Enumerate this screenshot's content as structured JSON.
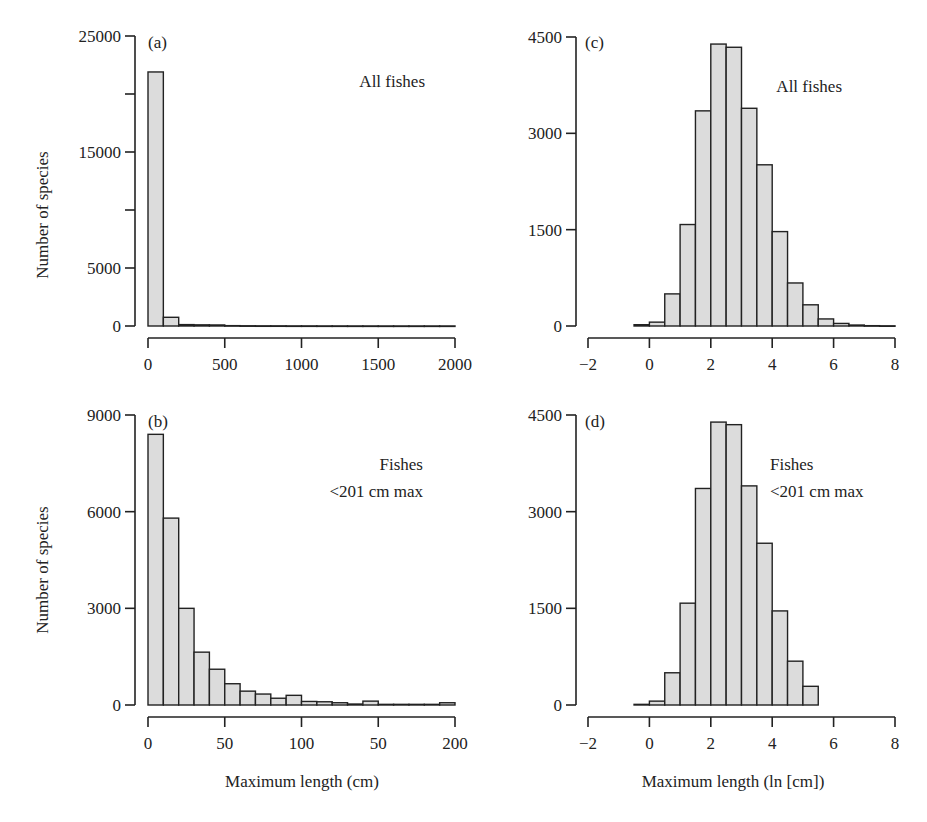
{
  "figure": {
    "y_axis_title": "Number of species",
    "x_axis_title_left": "Maximum length (cm)",
    "x_axis_title_right": "Maximum length (ln [cm])"
  },
  "colors": {
    "bar_fill": "#dcdcdc",
    "stroke": "#222222",
    "background": "#ffffff"
  },
  "chart_data": [
    {
      "id": "a",
      "type": "bar",
      "panel_label": "(a)",
      "annotation": [
        "All fishes"
      ],
      "title": "",
      "xlabel": "",
      "ylabel": "Number of species",
      "xlim": [
        0,
        2000
      ],
      "ylim": [
        0,
        25000
      ],
      "x_ticks": [
        0,
        500,
        1000,
        1500,
        2000
      ],
      "x_tick_labels": [
        "0",
        "500",
        "1000",
        "1500",
        "2000"
      ],
      "y_ticks": [
        0,
        5000,
        10000,
        15000,
        20000,
        25000
      ],
      "y_tick_labels": [
        "0",
        "5000",
        "",
        "15000",
        "",
        "25000"
      ],
      "bin_start": 0,
      "bin_width": 100,
      "values": [
        21900,
        750,
        120,
        100,
        90,
        30,
        20,
        15,
        15,
        10,
        10,
        8,
        8,
        6,
        6,
        5,
        5,
        5,
        5,
        5
      ],
      "grid": false,
      "layout": {
        "axis_x": 135,
        "y_top": 36,
        "y_zero": 326,
        "x_axis_y": 338,
        "x_left": 148,
        "x_right": 455,
        "label_x": 148,
        "label_y": 48,
        "annot_x": 425,
        "annot_y": 87
      }
    },
    {
      "id": "b",
      "type": "bar",
      "panel_label": "(b)",
      "annotation": [
        "Fishes",
        "<201 cm max"
      ],
      "title": "",
      "xlabel": "Maximum length (cm)",
      "ylabel": "Number of species",
      "xlim": [
        0,
        200
      ],
      "ylim": [
        0,
        9000
      ],
      "x_ticks": [
        0,
        50,
        100,
        150,
        200
      ],
      "x_tick_labels": [
        "0",
        "50",
        "100",
        "50",
        "200"
      ],
      "y_ticks": [
        0,
        3000,
        6000,
        9000
      ],
      "y_tick_labels": [
        "0",
        "3000",
        "6000",
        "9000"
      ],
      "bin_start": 0,
      "bin_width": 10,
      "values": [
        8400,
        5800,
        3000,
        1640,
        1110,
        660,
        430,
        340,
        210,
        300,
        110,
        100,
        70,
        30,
        120,
        20,
        20,
        20,
        20,
        70
      ],
      "grid": false,
      "layout": {
        "axis_x": 135,
        "y_top": 415,
        "y_zero": 705,
        "x_axis_y": 717,
        "x_left": 148,
        "x_right": 455,
        "label_x": 148,
        "label_y": 427,
        "annot_x": 423,
        "annot_y": 470
      }
    },
    {
      "id": "c",
      "type": "bar",
      "panel_label": "(c)",
      "annotation": [
        "All fishes"
      ],
      "title": "",
      "xlabel": "",
      "ylabel": "",
      "xlim": [
        -2,
        8
      ],
      "ylim": [
        0,
        4500
      ],
      "x_ticks": [
        -2,
        0,
        2,
        4,
        6,
        8
      ],
      "x_tick_labels": [
        "−2",
        "0",
        "2",
        "4",
        "6",
        "8"
      ],
      "y_ticks": [
        0,
        1500,
        3000,
        4500
      ],
      "y_tick_labels": [
        "0",
        "1500",
        "3000",
        "4500"
      ],
      "bin_start": -0.5,
      "bin_width": 0.5,
      "values": [
        20,
        60,
        500,
        1580,
        3350,
        4390,
        4340,
        3390,
        2510,
        1470,
        670,
        330,
        110,
        40,
        15,
        5,
        3
      ],
      "grid": false,
      "layout": {
        "axis_x": 576,
        "y_top": 37,
        "y_zero": 326,
        "x_axis_y": 338,
        "x_left": 588,
        "x_right": 895,
        "label_x": 585,
        "label_y": 48,
        "annot_x": 842,
        "annot_y": 92
      }
    },
    {
      "id": "d",
      "type": "bar",
      "panel_label": "(d)",
      "annotation": [
        "Fishes",
        "<201 cm max"
      ],
      "title": "",
      "xlabel": "Maximum length (ln [cm])",
      "ylabel": "",
      "xlim": [
        -2,
        8
      ],
      "ylim": [
        0,
        4500
      ],
      "x_ticks": [
        -2,
        0,
        2,
        4,
        6,
        8
      ],
      "x_tick_labels": [
        "−2",
        "0",
        "2",
        "4",
        "6",
        "8"
      ],
      "y_ticks": [
        0,
        1500,
        3000,
        4500
      ],
      "y_tick_labels": [
        "0",
        "1500",
        "3000",
        "4500"
      ],
      "bin_start": -0.5,
      "bin_width": 0.5,
      "values": [
        10,
        60,
        500,
        1580,
        3360,
        4390,
        4350,
        3400,
        2510,
        1460,
        680,
        290
      ],
      "grid": false,
      "layout": {
        "axis_x": 576,
        "y_top": 415,
        "y_zero": 705,
        "x_axis_y": 717,
        "x_left": 588,
        "x_right": 895,
        "label_x": 585,
        "label_y": 427,
        "annot_x": 770,
        "annot_y": 470
      }
    }
  ]
}
